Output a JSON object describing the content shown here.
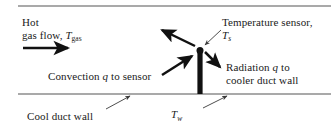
{
  "figure": {
    "name": "duct-temperature-sensor-heat-transfer-diagram",
    "background_color": "#ffffff",
    "ink_color": "#1a1a1a",
    "wall_color": "#8c8c8c"
  },
  "labels": {
    "hot_gas_flow": {
      "line1": "Hot",
      "line2_prefix": "gas flow, ",
      "symbol": "T",
      "subscript": "gas"
    },
    "temperature_sensor": {
      "line1": "Temperature sensor,",
      "symbol": "T",
      "subscript": "s"
    },
    "convection": {
      "prefix": "Convection ",
      "symbol": "q",
      "suffix": " to sensor"
    },
    "radiation": {
      "prefix": "Radiation ",
      "symbol": "q",
      "suffix": " to",
      "line2": "cooler duct wall"
    },
    "cool_duct_wall": {
      "text": "Cool duct wall"
    },
    "wall_temperature": {
      "symbol": "T",
      "subscript": "w"
    }
  },
  "geometry": {
    "top_wall": {
      "x1": 18,
      "y1": 6,
      "x2": 331,
      "y2": 6
    },
    "bottom_wall": {
      "x1": 18,
      "y1": 94,
      "x2": 331,
      "y2": 94
    },
    "sensor_probe": {
      "x": 197.5,
      "y_top": 52,
      "y_bottom": 94,
      "width": 5
    },
    "sensor_tip": {
      "cx": 200,
      "cy": 50,
      "r": 3.4
    },
    "flow_arrow": {
      "x1": 23,
      "y1": 48,
      "x2": 72,
      "y2": 48
    },
    "arrow_up_left": {
      "x1": 196,
      "y1": 46,
      "x2": 160,
      "y2": 29
    },
    "arrow_convection_in": {
      "x1": 163,
      "y1": 74,
      "x2": 194,
      "y2": 55
    },
    "arrow_radiation_out": {
      "x1": 205,
      "y1": 52,
      "x2": 222,
      "y2": 69
    },
    "leader_sensor_label": {
      "x1": 220,
      "y1": 30,
      "x2": 203,
      "y2": 46
    },
    "leader_cool_wall": {
      "x1": 108,
      "y1": 108,
      "x2": 131,
      "y2": 95
    },
    "leader_wall_temp": {
      "x1": 205,
      "y1": 107,
      "x2": 228,
      "y2": 95
    }
  }
}
